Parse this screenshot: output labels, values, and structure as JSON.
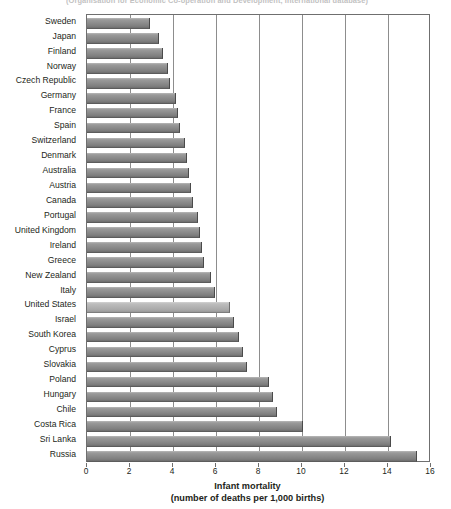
{
  "source_note": "(Organisation for Economic Co-operation and Development, International database)",
  "axis": {
    "title": "Infant mortality",
    "subtitle": "(number of deaths per 1,000 births)",
    "ticks": [
      "0",
      "2",
      "4",
      "6",
      "8",
      "10",
      "12",
      "14",
      "16"
    ]
  },
  "colors": {
    "bar": "#8c8c8c",
    "bar_highlight": "#b2b2b2",
    "axis": "#6f6f6f",
    "gridline": "#8d8d8d",
    "text": "#231f20"
  },
  "chart_data": {
    "type": "bar",
    "orientation": "horizontal",
    "title": "",
    "xlabel": "Infant mortality (number of deaths per 1,000 births)",
    "ylabel": "",
    "xlim": [
      0,
      16
    ],
    "xticks": [
      0,
      2,
      4,
      6,
      8,
      10,
      12,
      14,
      16
    ],
    "grid": "vertical",
    "legend": "none",
    "highlight_category": "United States",
    "categories": [
      "Sweden",
      "Japan",
      "Finland",
      "Norway",
      "Czech Republic",
      "Germany",
      "France",
      "Spain",
      "Switzerland",
      "Denmark",
      "Australia",
      "Austria",
      "Canada",
      "Portugal",
      "United Kingdom",
      "Ireland",
      "Greece",
      "New Zealand",
      "Italy",
      "United States",
      "Israel",
      "South Korea",
      "Cyprus",
      "Slovakia",
      "Poland",
      "Hungary",
      "Chile",
      "Costa Rica",
      "Sri Lanka",
      "Russia"
    ],
    "values": [
      2.9,
      3.3,
      3.5,
      3.7,
      3.8,
      4.1,
      4.2,
      4.3,
      4.5,
      4.6,
      4.7,
      4.8,
      4.9,
      5.1,
      5.2,
      5.3,
      5.4,
      5.7,
      5.9,
      6.6,
      6.8,
      7.0,
      7.2,
      7.4,
      8.4,
      8.6,
      8.8,
      10.0,
      14.1,
      15.3
    ]
  }
}
